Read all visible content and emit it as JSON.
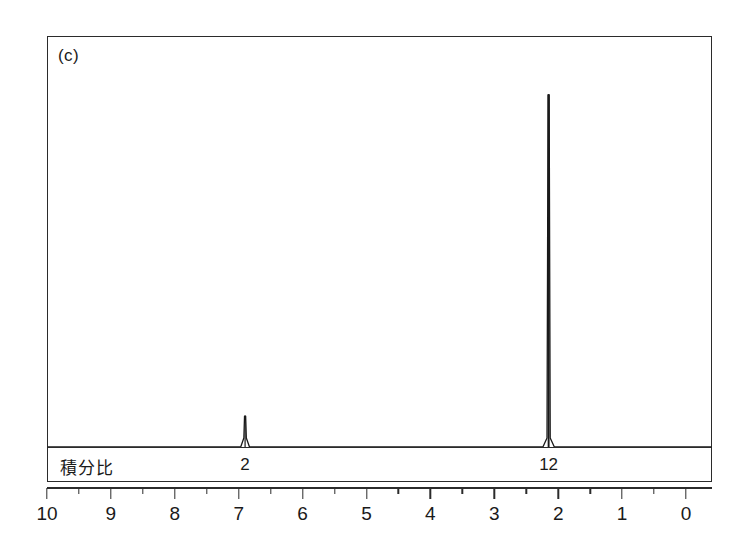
{
  "figure": {
    "panel_label": "(c)"
  },
  "integral": {
    "title": "積分比",
    "entries": [
      {
        "label": "2",
        "ppm": 6.9
      },
      {
        "label": "12",
        "ppm": 2.15
      }
    ]
  },
  "axis": {
    "tick_labels": [
      "10",
      "9",
      "8",
      "7",
      "6",
      "5",
      "4",
      "3",
      "2",
      "1",
      "0"
    ],
    "major_ticks": [
      10,
      9,
      8,
      7,
      6,
      5,
      4,
      3,
      2,
      1,
      0
    ],
    "minor_ticks": [
      9.5,
      8.5,
      7.5,
      6.5,
      5.5,
      4.5,
      3.5,
      2.5,
      1.5,
      0.5
    ]
  },
  "colors": {
    "trace": "#1a1a1a",
    "frame": "#2b2b2b",
    "background": "#ffffff"
  },
  "chart_data": {
    "type": "line",
    "title": "(c)",
    "xlabel": "",
    "ylabel": "",
    "xlim": [
      10,
      0
    ],
    "ylim": [
      0,
      100
    ],
    "grid": false,
    "legend": "none",
    "x_axis_direction": "reversed",
    "series": [
      {
        "name": "1H NMR spectrum",
        "peaks": [
          {
            "ppm": 6.9,
            "relative_height": 8,
            "integral": 2
          },
          {
            "ppm": 2.15,
            "relative_height": 91,
            "integral": 12
          }
        ]
      }
    ],
    "annotations": [
      {
        "text": "積分比",
        "ppm": 9.7,
        "role": "integral-row-title"
      },
      {
        "text": "2",
        "ppm": 6.9,
        "role": "integral-value"
      },
      {
        "text": "12",
        "ppm": 2.15,
        "role": "integral-value"
      }
    ]
  }
}
